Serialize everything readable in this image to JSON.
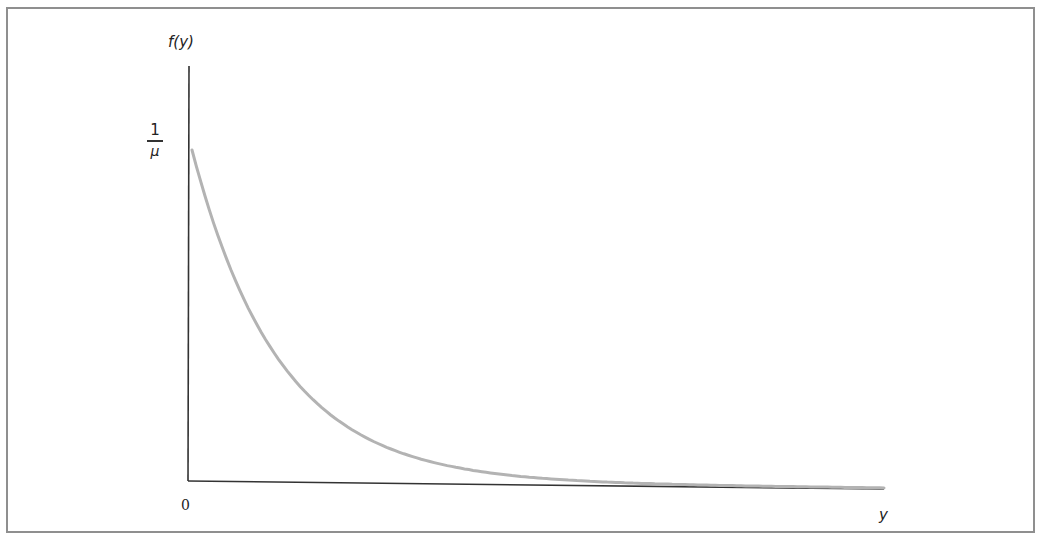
{
  "chart_data": {
    "type": "line",
    "title": "",
    "xlabel": "y",
    "ylabel": "f(y)",
    "x_tick_labels": [
      "0"
    ],
    "y_tick_labels": [
      "1/μ"
    ],
    "y_tick_label_parts": {
      "numerator": "1",
      "denominator": "μ"
    },
    "function": "f(y) = (1/μ) e^(-y/μ)",
    "series": [
      {
        "name": "f(y)",
        "x": [
          0,
          0.5,
          1,
          1.5,
          2,
          2.5,
          3,
          3.5,
          4,
          5,
          6,
          7,
          8
        ],
        "values": [
          1.0,
          0.607,
          0.368,
          0.223,
          0.135,
          0.082,
          0.05,
          0.03,
          0.018,
          0.007,
          0.002,
          0.001,
          0.0
        ],
        "color": "#b3b3b3"
      }
    ],
    "xlim": [
      0,
      8
    ],
    "ylim": [
      0,
      1.0
    ],
    "y_units": "multiples of 1/μ",
    "grid": false,
    "legend": null
  },
  "labels": {
    "y_axis": "f(y)",
    "x_axis": "y",
    "origin": "0",
    "y_tick_num": "1",
    "y_tick_den": "μ"
  },
  "colors": {
    "axis": "#333333",
    "curve": "#b3b3b3",
    "frame": "#8f8f8f"
  }
}
